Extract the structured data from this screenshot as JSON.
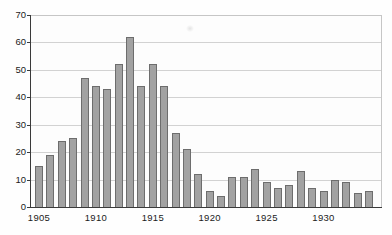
{
  "chart_data": {
    "type": "bar",
    "title": "",
    "xlabel": "",
    "ylabel": "",
    "categories": [
      "1905",
      "1906",
      "1907",
      "1908",
      "1909",
      "1910",
      "1911",
      "1912",
      "1913",
      "1914",
      "1915",
      "1916",
      "1917",
      "1918",
      "1919",
      "1920",
      "1921",
      "1922",
      "1923",
      "1924",
      "1925",
      "1926",
      "1927",
      "1928",
      "1929",
      "1930",
      "1931",
      "1932",
      "1933",
      "1934"
    ],
    "values": [
      15,
      19,
      24,
      25,
      47,
      44,
      43,
      52,
      62,
      44,
      52,
      44,
      27,
      21,
      12,
      6,
      4,
      11,
      11,
      14,
      9,
      7,
      8,
      13,
      7,
      6,
      10,
      9,
      5,
      6
    ],
    "ylim": [
      0,
      70
    ],
    "y_ticks": [
      0,
      10,
      20,
      30,
      40,
      50,
      60,
      70
    ],
    "x_tick_labels": [
      "1905",
      "1910",
      "1915",
      "1920",
      "1925",
      "1930"
    ],
    "x_tick_positions": [
      0,
      5,
      10,
      15,
      20,
      25
    ],
    "grid": "horizontal gridlines on",
    "legend": "none",
    "colors": {
      "bar_fill": "#a2a2a2",
      "bar_border": "#6d6d6d",
      "gridline": "#d2d2d2",
      "axis": "#3a3a3a",
      "plot_border_light": "#c6c6c6",
      "label_text": "#1b1b1b",
      "background": "#fefefe"
    }
  }
}
